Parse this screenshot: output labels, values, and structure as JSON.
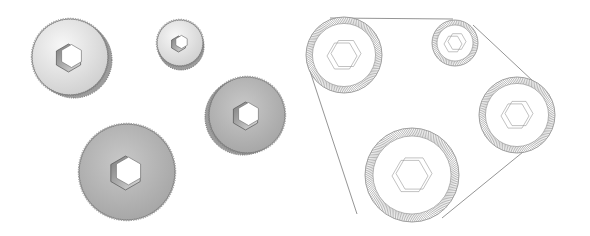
{
  "figure": {
    "colors": {
      "background": "#ffffff",
      "light_face": "#e4e4e4",
      "dark_face": "#b4b4b4",
      "knurl": "#6f6f6f",
      "line": "#8a8a8a",
      "hex_shadow": "#9a9a9a"
    },
    "left_panel": {
      "label": "shaded-thumbscrews",
      "wheels": [
        {
          "id": "wheel-a",
          "cx": 70,
          "cy": 57,
          "r": 38,
          "shade": "light",
          "hex": 14,
          "knurl_side": "right"
        },
        {
          "id": "wheel-b",
          "cx": 180,
          "cy": 43,
          "r": 23,
          "shade": "light",
          "hex": 8,
          "knurl_side": "bottom"
        },
        {
          "id": "wheel-c",
          "cx": 247,
          "cy": 115,
          "r": 38,
          "shade": "dark",
          "hex": 14,
          "knurl_side": "left"
        },
        {
          "id": "wheel-d",
          "cx": 127,
          "cy": 172,
          "r": 48,
          "shade": "dark",
          "hex": 17,
          "knurl_side": "none"
        }
      ]
    },
    "right_panel": {
      "label": "belt-drive-wireframe",
      "wheels": [
        {
          "id": "pulley-a",
          "cx": 344,
          "cy": 55,
          "r": 38,
          "hex": 15
        },
        {
          "id": "pulley-b",
          "cx": 455,
          "cy": 43,
          "r": 23,
          "hex": 9
        },
        {
          "id": "pulley-c",
          "cx": 517,
          "cy": 115,
          "r": 38,
          "hex": 14
        },
        {
          "id": "pulley-d",
          "cx": 412,
          "cy": 175,
          "r": 47,
          "hex": 18
        }
      ],
      "belt_path": "M 305 60 L 355 173 M 320 18 L 452 18 M 470 22 L 548 90 M 547 128 L 440 215"
    }
  }
}
